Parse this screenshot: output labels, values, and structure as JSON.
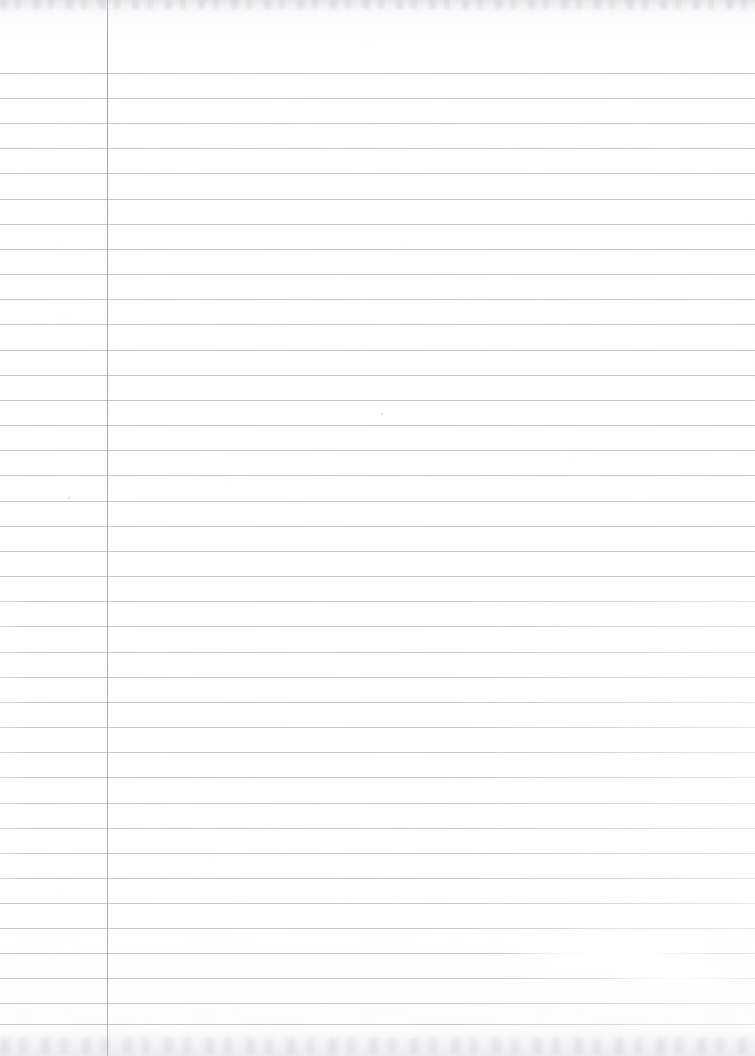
{
  "document": {
    "kind": "scanned-ruled-notebook-page",
    "title": "Blank ruled notebook page",
    "page_width_px": 755,
    "page_height_px": 1056,
    "paper_color": "#ffffff",
    "is_blank": true,
    "written_content": "",
    "visible_text": ""
  },
  "ruling": {
    "line_color": "#c4c8ce",
    "line_thickness_px": 1,
    "line_spacing_px": 25.1,
    "first_line_y_px": 73,
    "line_count": 39,
    "line_y_positions": [
      73,
      98,
      123,
      148,
      173,
      199,
      224,
      249,
      274,
      299,
      324,
      350,
      375,
      400,
      425,
      450,
      475,
      501,
      526,
      551,
      576,
      601,
      626,
      652,
      677,
      702,
      727,
      752,
      777,
      803,
      828,
      853,
      878,
      903,
      928,
      953,
      978,
      1003,
      1024
    ]
  },
  "margin_rule": {
    "orientation": "vertical",
    "x_px": 107,
    "color": "#a7acb3",
    "thickness_px": 1,
    "top_y_px": 0,
    "bottom_y_px": 1056
  },
  "artifacts": {
    "top_edge_shadow": true,
    "bottom_edge_shadow": true,
    "glare_highlight": {
      "x_px": 560,
      "y_px": 948,
      "width_px": 120,
      "height_px": 26
    },
    "specks": [
      {
        "x_px": 68,
        "y_px": 497,
        "size_px": 2
      },
      {
        "x_px": 381,
        "y_px": 413,
        "size_px": 2
      },
      {
        "x_px": 214,
        "y_px": 862,
        "size_px": 1
      }
    ]
  }
}
